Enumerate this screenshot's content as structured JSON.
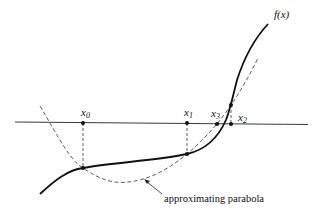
{
  "diagram": {
    "title": "",
    "function_label": "f(x)",
    "parabola_label": "approximating parabola",
    "points": [
      {
        "id": "x0",
        "name": "x",
        "sub": "0"
      },
      {
        "id": "x1",
        "name": "x",
        "sub": "1"
      },
      {
        "id": "x3",
        "name": "x",
        "sub": "3"
      },
      {
        "id": "x2",
        "name": "x",
        "sub": "2"
      }
    ],
    "colors": {
      "curve": "#111111",
      "parabola": "#333333",
      "axis": "#222222"
    }
  }
}
